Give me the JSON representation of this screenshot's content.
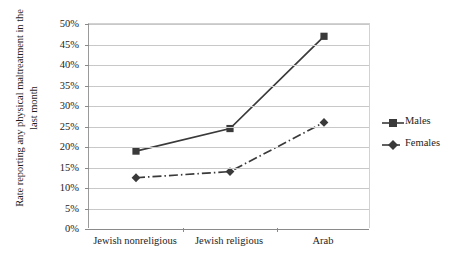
{
  "chart_data": {
    "type": "line",
    "title": "",
    "xlabel": "",
    "ylabel": "Rate reporting any physical maltreatment in the last month",
    "ylabel_line1": "Rate reporting any physical maltreatment in the",
    "ylabel_line2": "last month",
    "categories": [
      "Jewish nonreligious",
      "Jewish religious",
      "Arab"
    ],
    "ylim": [
      0,
      50
    ],
    "ytick_labels": [
      "0%",
      "5%",
      "10%",
      "15%",
      "20%",
      "25%",
      "30%",
      "35%",
      "40%",
      "45%",
      "50%"
    ],
    "ytick_values": [
      0,
      5,
      10,
      15,
      20,
      25,
      30,
      35,
      40,
      45,
      50
    ],
    "grid": true,
    "legend_position": "right",
    "series": [
      {
        "name": "Males",
        "values": [
          19,
          24.5,
          47
        ],
        "marker": "square",
        "line_style": "solid",
        "color": "#3a3a3a"
      },
      {
        "name": "Females",
        "values": [
          12.5,
          14,
          26
        ],
        "marker": "diamond",
        "line_style": "dash-dot",
        "color": "#3a3a3a"
      }
    ]
  },
  "legend": {
    "items": [
      {
        "label": "Males",
        "marker": "square-marker",
        "style": "solid"
      },
      {
        "label": "Females",
        "marker": "diamond-marker",
        "style": "dash-dot"
      }
    ]
  }
}
